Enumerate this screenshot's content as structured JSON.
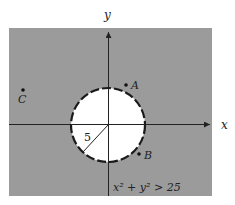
{
  "diagram": {
    "type": "inequality-region",
    "inequality_label": "x² + y² > 25",
    "axes": {
      "x_label": "x",
      "y_label": "y"
    },
    "circle": {
      "radius_label": "5",
      "boundary_style": "dashed"
    },
    "points": [
      {
        "label": "A",
        "position": "just outside circle, upper right"
      },
      {
        "label": "B",
        "position": "just outside circle, lower right"
      },
      {
        "label": "C",
        "position": "far left, above x-axis"
      }
    ],
    "colors": {
      "shaded_region": "#9b9b9b",
      "circle_interior": "#ffffff",
      "ink": "#222222"
    }
  }
}
